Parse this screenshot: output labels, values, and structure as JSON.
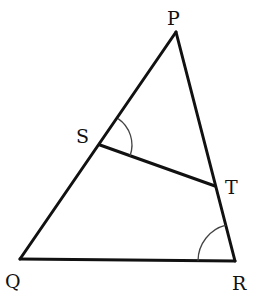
{
  "diagram": {
    "type": "triangle",
    "vertices": {
      "P": {
        "label": "P",
        "x": 176,
        "y": 32,
        "label_x": 167,
        "label_y": 25
      },
      "Q": {
        "label": "Q",
        "x": 20,
        "y": 259,
        "label_x": 5,
        "label_y": 287
      },
      "R": {
        "label": "R",
        "x": 235,
        "y": 261,
        "label_x": 233,
        "label_y": 289
      },
      "S": {
        "label": "S",
        "x": 100,
        "y": 145,
        "label_x": 76,
        "label_y": 143
      },
      "T": {
        "label": "T",
        "x": 215,
        "y": 186,
        "label_x": 225,
        "label_y": 192
      }
    },
    "segments": [
      "PQ",
      "PR",
      "QR",
      "ST"
    ],
    "angle_marks": [
      {
        "at": "S",
        "between": [
          "SP",
          "ST"
        ],
        "radius": 32
      },
      {
        "at": "R",
        "between": [
          "RQ",
          "RP"
        ],
        "radius": 37
      }
    ],
    "stroke_color": "#111111",
    "arc_color": "#444444"
  }
}
